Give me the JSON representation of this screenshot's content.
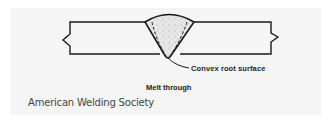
{
  "diagram": {
    "title": "Melt through",
    "callouts": [
      {
        "label": "Convex root surface"
      }
    ],
    "credit": "American Welding Society",
    "elements": [
      "left-plate",
      "right-plate",
      "weld-bead",
      "fusion-line",
      "break-line-left",
      "break-line-right",
      "root-leader-line"
    ]
  },
  "colors": {
    "line": "#1a1a1a",
    "panel_bg": "#f5f5f5",
    "weld_fill": "#d8d8d8"
  }
}
